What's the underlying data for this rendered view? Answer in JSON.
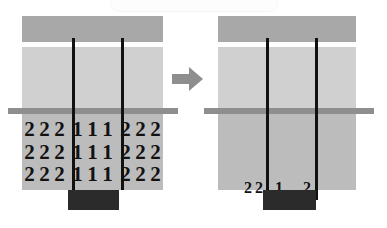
{
  "figure": {
    "title": "",
    "background_color": "#ffffff",
    "arrow_icon": "right-arrow-icon",
    "colors": {
      "panel_dark": "#a8a8a8",
      "panel_light": "#d0d0d0",
      "panel_mid": "#bcbcbc",
      "horizontal_bar": "#8e8e8e",
      "vertical_line": "#111111",
      "black_block": "#2b2b2b",
      "digit_text": "#121212",
      "card": "#fdfdfe"
    }
  },
  "left_panel": {
    "name": "before-state",
    "digit_rows": [
      {
        "left": [
          "2",
          "2",
          "2"
        ],
        "middle": [
          "1",
          "1",
          "1"
        ],
        "right": [
          "2",
          "2",
          "2"
        ]
      },
      {
        "left": [
          "2",
          "2",
          "2"
        ],
        "middle": [
          "1",
          "1",
          "1"
        ],
        "right": [
          "2",
          "2",
          "2"
        ]
      },
      {
        "left": [
          "2",
          "2",
          "2"
        ],
        "middle": [
          "1",
          "1",
          "1"
        ],
        "right": [
          "2",
          "2",
          "2"
        ]
      }
    ]
  },
  "right_panel": {
    "name": "after-state",
    "labels": [
      "2",
      "2",
      "1",
      "2"
    ]
  }
}
